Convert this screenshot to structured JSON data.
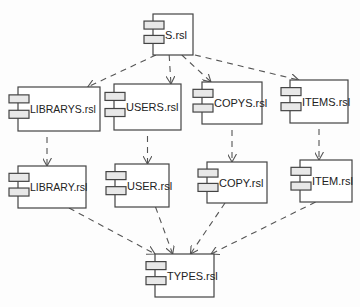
{
  "diagram": {
    "type": "UML component diagram",
    "components": [
      {
        "id": "s",
        "label": "S.rsl",
        "x": 153,
        "y": 14,
        "w": 40,
        "h": 41
      },
      {
        "id": "librarys",
        "label": "LIBRARYS.rsl",
        "x": 18,
        "y": 87,
        "w": 82,
        "h": 44
      },
      {
        "id": "users",
        "label": "USERS.rsl",
        "x": 114,
        "y": 84,
        "w": 67,
        "h": 46
      },
      {
        "id": "copys",
        "label": "COPYS.rsl",
        "x": 202,
        "y": 82,
        "w": 60,
        "h": 42
      },
      {
        "id": "items",
        "label": "ITEMS.rsl",
        "x": 290,
        "y": 80,
        "w": 58,
        "h": 43
      },
      {
        "id": "library",
        "label": "LIBRARY.rsl",
        "x": 18,
        "y": 166,
        "w": 68,
        "h": 42
      },
      {
        "id": "user",
        "label": "USER.rsl",
        "x": 115,
        "y": 164,
        "w": 54,
        "h": 43
      },
      {
        "id": "copy",
        "label": "COPY.rsl",
        "x": 207,
        "y": 162,
        "w": 60,
        "h": 41
      },
      {
        "id": "item",
        "label": "ITEM.rsl",
        "x": 300,
        "y": 160,
        "w": 52,
        "h": 42
      },
      {
        "id": "types",
        "label": "TYPES.rsl",
        "x": 155,
        "y": 254,
        "w": 59,
        "h": 43
      }
    ],
    "dependencies": [
      {
        "from": "s",
        "to": "librarys"
      },
      {
        "from": "s",
        "to": "users"
      },
      {
        "from": "s",
        "to": "copys"
      },
      {
        "from": "s",
        "to": "items"
      },
      {
        "from": "librarys",
        "to": "library"
      },
      {
        "from": "users",
        "to": "user"
      },
      {
        "from": "copys",
        "to": "copy"
      },
      {
        "from": "items",
        "to": "item"
      },
      {
        "from": "library",
        "to": "types"
      },
      {
        "from": "user",
        "to": "types"
      },
      {
        "from": "copy",
        "to": "types"
      },
      {
        "from": "item",
        "to": "types"
      }
    ]
  }
}
